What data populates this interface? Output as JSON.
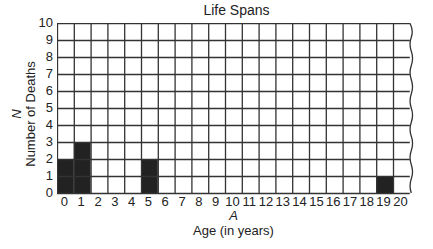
{
  "chart_data": {
    "type": "bar",
    "title": "Life Spans",
    "xlabel_var": "A",
    "xlabel": "Age (in years)",
    "ylabel_var": "N",
    "ylabel": "Number of Deaths",
    "x_ticks": [
      0,
      1,
      2,
      3,
      4,
      5,
      6,
      7,
      8,
      9,
      10,
      11,
      12,
      13,
      14,
      15,
      16,
      17,
      18,
      19,
      20
    ],
    "y_ticks": [
      0,
      1,
      2,
      3,
      4,
      5,
      6,
      7,
      8,
      9,
      10
    ],
    "xlim": [
      0,
      21
    ],
    "ylim": [
      0,
      10
    ],
    "grid": true,
    "categories": [
      0,
      1,
      5,
      19
    ],
    "values": [
      2,
      3,
      2,
      1
    ],
    "bar_color": "#222222",
    "grid_color": "#333333",
    "annotations": [
      "right edge drawn as wavy torn line"
    ]
  }
}
